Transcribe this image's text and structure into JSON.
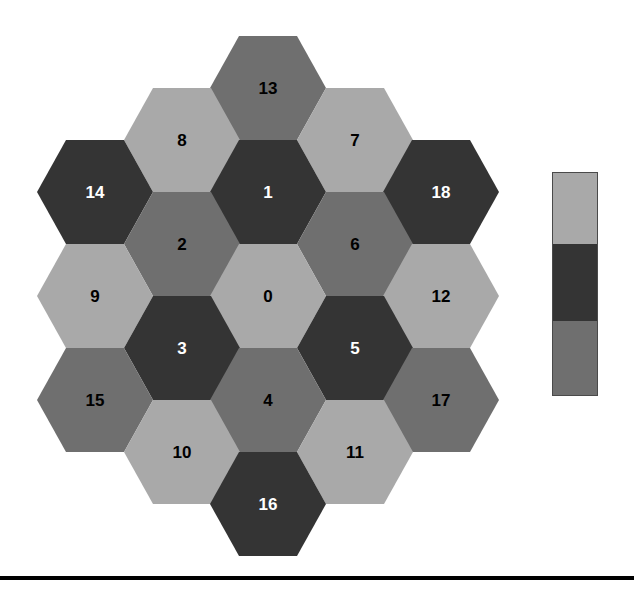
{
  "figure": {
    "type": "hexagonal-grid-map",
    "width": 634,
    "height": 592,
    "background": "#ffffff"
  },
  "palette": {
    "light": "#a9a9a9",
    "dark": "#343434",
    "medium": "#6f6f6f",
    "outline": "#4a4a4a",
    "rule": "#000000",
    "label_on_dark": "#ffffff",
    "label_on_light": "#000000"
  },
  "hex_grid": {
    "orientation": "pointy-left-right",
    "hex_width": 116,
    "hex_height": 104,
    "col_spacing": 86.5,
    "row_spacing": 104,
    "cells": [
      {
        "label": "13",
        "cx": 268,
        "cy": 88,
        "tone": "medium",
        "text_color": "label_on_light"
      },
      {
        "label": "8",
        "cx": 182,
        "cy": 140,
        "tone": "light",
        "text_color": "label_on_light"
      },
      {
        "label": "7",
        "cx": 355,
        "cy": 140,
        "tone": "light",
        "text_color": "label_on_light"
      },
      {
        "label": "14",
        "cx": 95,
        "cy": 192,
        "tone": "dark",
        "text_color": "label_on_dark"
      },
      {
        "label": "1",
        "cx": 268,
        "cy": 192,
        "tone": "dark",
        "text_color": "label_on_dark"
      },
      {
        "label": "18",
        "cx": 441,
        "cy": 192,
        "tone": "dark",
        "text_color": "label_on_dark"
      },
      {
        "label": "2",
        "cx": 182,
        "cy": 244,
        "tone": "medium",
        "text_color": "label_on_light"
      },
      {
        "label": "6",
        "cx": 355,
        "cy": 244,
        "tone": "medium",
        "text_color": "label_on_light"
      },
      {
        "label": "9",
        "cx": 95,
        "cy": 296,
        "tone": "light",
        "text_color": "label_on_light"
      },
      {
        "label": "0",
        "cx": 268,
        "cy": 296,
        "tone": "light",
        "text_color": "label_on_light"
      },
      {
        "label": "12",
        "cx": 441,
        "cy": 296,
        "tone": "light",
        "text_color": "label_on_light"
      },
      {
        "label": "3",
        "cx": 182,
        "cy": 348,
        "tone": "dark",
        "text_color": "label_on_dark"
      },
      {
        "label": "5",
        "cx": 355,
        "cy": 348,
        "tone": "dark",
        "text_color": "label_on_dark"
      },
      {
        "label": "15",
        "cx": 95,
        "cy": 400,
        "tone": "medium",
        "text_color": "label_on_light"
      },
      {
        "label": "4",
        "cx": 268,
        "cy": 400,
        "tone": "medium",
        "text_color": "label_on_light"
      },
      {
        "label": "17",
        "cx": 441,
        "cy": 400,
        "tone": "medium",
        "text_color": "label_on_light"
      },
      {
        "label": "10",
        "cx": 182,
        "cy": 452,
        "tone": "light",
        "text_color": "label_on_light"
      },
      {
        "label": "11",
        "cx": 355,
        "cy": 452,
        "tone": "light",
        "text_color": "label_on_light"
      },
      {
        "label": "16",
        "cx": 268,
        "cy": 504,
        "tone": "dark",
        "text_color": "label_on_dark"
      }
    ]
  },
  "colorbar": {
    "x": 552,
    "y": 172,
    "width": 46,
    "height": 224,
    "segments": [
      {
        "tone": "light",
        "height_px": 71
      },
      {
        "tone": "dark",
        "height_px": 77
      },
      {
        "tone": "medium",
        "height_px": 76
      }
    ]
  },
  "baseline_rule": {
    "y": 576,
    "thickness": 4
  }
}
